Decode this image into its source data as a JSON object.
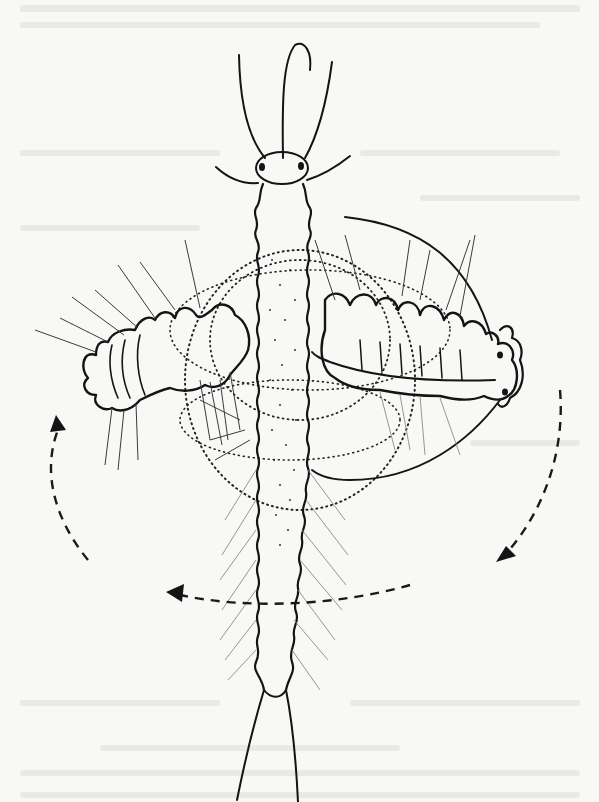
{
  "figure": {
    "colors": {
      "paper": "#f8f8f6",
      "ink": "#141414",
      "faint_ink": "#8a8a8a",
      "show_through": "#e9e9e6"
    },
    "arrows": [
      {
        "name": "left-up-arrow",
        "direction": "up"
      },
      {
        "name": "right-down-arrow",
        "direction": "down-left"
      },
      {
        "name": "bottom-left-arrow",
        "direction": "left"
      }
    ],
    "annotations": []
  }
}
